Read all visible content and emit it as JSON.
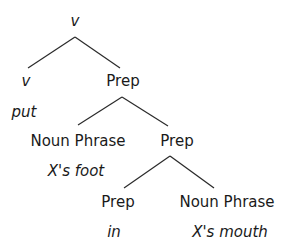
{
  "tree": {
    "root": {
      "label": "v"
    },
    "level1": {
      "left": {
        "label": "v",
        "word": "put"
      },
      "right": {
        "label": "Prep"
      }
    },
    "level2": {
      "left": {
        "label": "Noun Phrase",
        "word": "X's foot"
      },
      "right": {
        "label": "Prep"
      }
    },
    "level3": {
      "left": {
        "label": "Prep",
        "word": "in"
      },
      "right": {
        "label": "Noun Phrase",
        "word": "X's mouth"
      }
    }
  }
}
